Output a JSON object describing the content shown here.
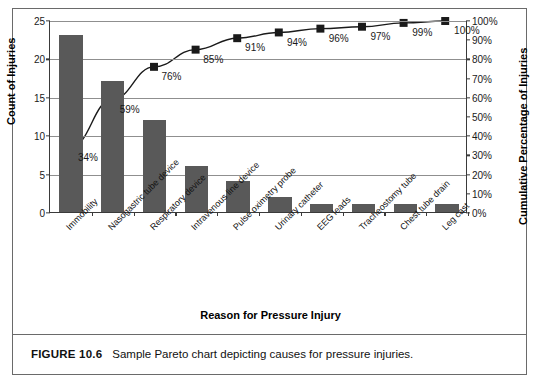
{
  "figure": {
    "number_label": "FIGURE 10.6",
    "caption_text": "Sample Pareto chart depicting causes for pressure injuries."
  },
  "chart_data": {
    "type": "bar",
    "title": "",
    "subtitle": "",
    "xlabel": "Reason for Pressure Injury",
    "ylabel": "Count of Injuries",
    "y2label": "Cumulative Percentage of Injuries",
    "grid": true,
    "legend": "none",
    "ylim": [
      0,
      25
    ],
    "y2lim": [
      0,
      100
    ],
    "yticks": [
      "0",
      "5",
      "10",
      "15",
      "20",
      "25"
    ],
    "ytick_values": [
      0,
      5,
      10,
      15,
      20,
      25
    ],
    "y2ticks": [
      "0%",
      "10%",
      "20%",
      "30%",
      "40%",
      "50%",
      "60%",
      "70%",
      "80%",
      "90%",
      "100%"
    ],
    "y2tick_values": [
      0,
      10,
      20,
      30,
      40,
      50,
      60,
      70,
      80,
      90,
      100
    ],
    "categories": [
      "Immobility",
      "Nasogastric tube device",
      "Respiratory device",
      "Intravenous line device",
      "Pulse oximetry probe",
      "Urinary catheter",
      "EEG leads",
      "Tracheostomy tube",
      "Chest tube drain",
      "Leg cast"
    ],
    "series": [
      {
        "name": "Count of Injuries",
        "type": "bar",
        "color": "#595959",
        "values": [
          23,
          17,
          12,
          6,
          4,
          2,
          1,
          1,
          1,
          1
        ]
      },
      {
        "name": "Cumulative Percentage of Injuries",
        "type": "line",
        "color": "#1a1a1a",
        "marker": "square",
        "values": [
          34,
          59,
          76,
          85,
          91,
          94,
          96,
          97,
          99,
          100
        ],
        "data_labels": [
          "34%",
          "59%",
          "76%",
          "85%",
          "91%",
          "94%",
          "96%",
          "97%",
          "99%",
          "100%"
        ]
      }
    ]
  }
}
